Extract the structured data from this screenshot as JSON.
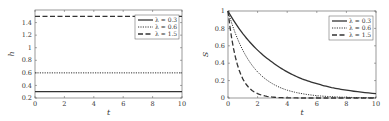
{
  "chart_data": [
    {
      "type": "line",
      "title": "",
      "xlabel": "t",
      "ylabel": "h",
      "xlim": [
        0,
        10
      ],
      "ylim": [
        0.2,
        1.6
      ],
      "xticks": [
        "0",
        "2",
        "4",
        "6",
        "8",
        "10"
      ],
      "yticks": [
        "0.2",
        "0.4",
        "0.6",
        "0.8",
        "1",
        "1.2",
        "1.4"
      ],
      "grid": false,
      "legend_position": "upper right",
      "x": [
        0,
        10
      ],
      "series": [
        {
          "name": "λ = 0.3",
          "style": "solid",
          "values": [
            0.3,
            0.3
          ]
        },
        {
          "name": "λ = 0.6",
          "style": "dotted",
          "values": [
            0.6,
            0.6
          ]
        },
        {
          "name": "λ = 1.5",
          "style": "dashed",
          "values": [
            1.5,
            1.5
          ]
        }
      ]
    },
    {
      "type": "line",
      "title": "",
      "xlabel": "t",
      "ylabel": "S",
      "xlim": [
        0,
        10
      ],
      "ylim": [
        0,
        1
      ],
      "xticks": [
        "0",
        "2",
        "4",
        "6",
        "8",
        "10"
      ],
      "yticks": [
        "0",
        "0.2",
        "0.4",
        "0.6",
        "0.8",
        "1"
      ],
      "grid": false,
      "legend_position": "upper right",
      "x": [
        0,
        1,
        2,
        3,
        4,
        5,
        6,
        7,
        8,
        10
      ],
      "series": [
        {
          "name": "λ = 0.3",
          "style": "solid",
          "values": [
            1,
            0.74,
            0.55,
            0.41,
            0.3,
            0.22,
            0.165,
            0.12,
            0.09,
            0.05
          ]
        },
        {
          "name": "λ = 0.6",
          "style": "dotted",
          "values": [
            1,
            0.55,
            0.3,
            0.165,
            0.09,
            0.05,
            0.027,
            0.015,
            0.008,
            0.002
          ]
        },
        {
          "name": "λ = 1.5",
          "style": "dashed",
          "values": [
            1,
            0.22,
            0.05,
            0.011,
            0.002,
            0.0,
            0.0,
            0.0,
            0.0,
            0.0
          ]
        }
      ]
    }
  ]
}
